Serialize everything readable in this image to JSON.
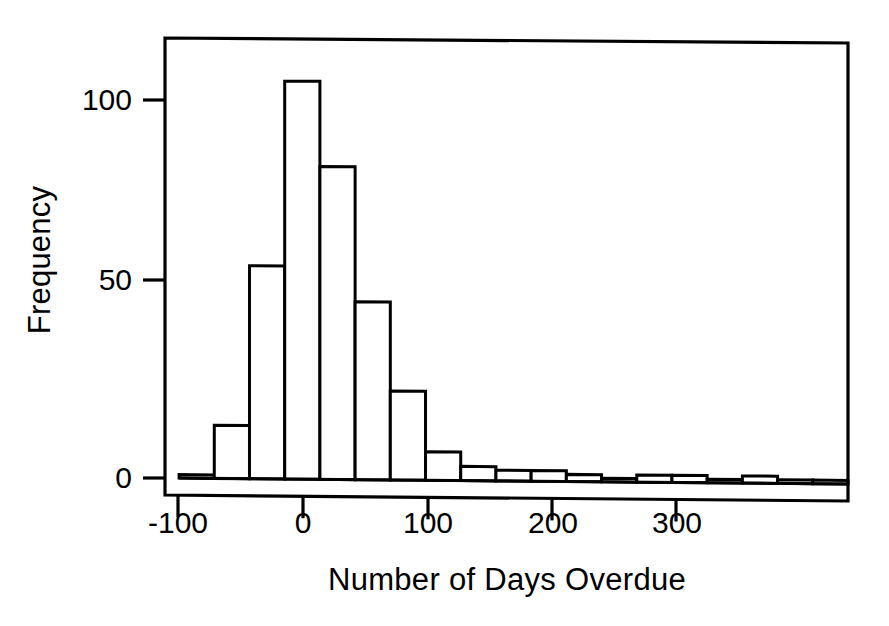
{
  "chart_data": {
    "type": "bar",
    "subtype": "histogram",
    "title": "",
    "xlabel": "Number of Days Overdue",
    "ylabel": "Frequency",
    "xlim": [
      -88,
      300
    ],
    "ylim": [
      0,
      118
    ],
    "xticks": [
      -100,
      0,
      100,
      200,
      300
    ],
    "xtick_labels": [
      "-100",
      "0",
      "100",
      "200",
      "300"
    ],
    "yticks": [
      0,
      50,
      100
    ],
    "ytick_labels": [
      "0",
      "50",
      "100"
    ],
    "grid": false,
    "legend": null,
    "bin_width": 20,
    "bin_edges": [
      -80,
      -60,
      -40,
      -20,
      0,
      20,
      40,
      60,
      80,
      100,
      120,
      140,
      160,
      180,
      200,
      220,
      240,
      260,
      280,
      300
    ],
    "bin_centers": [
      -70,
      -50,
      -30,
      -10,
      10,
      30,
      50,
      70,
      90,
      110,
      130,
      150,
      170,
      190,
      210,
      230,
      250,
      270,
      290
    ],
    "values": [
      1,
      15,
      60,
      112,
      88,
      50,
      25,
      8,
      4,
      3,
      3,
      2,
      1,
      2,
      2,
      1,
      2,
      1,
      1
    ],
    "bar_fill": "#ffffff",
    "bar_edge": "#000000",
    "axis_color": "#000000",
    "background": "#ffffff"
  },
  "axes": {
    "frame": {
      "left": 165,
      "top": 38,
      "right": 848,
      "bottom": 495
    }
  }
}
